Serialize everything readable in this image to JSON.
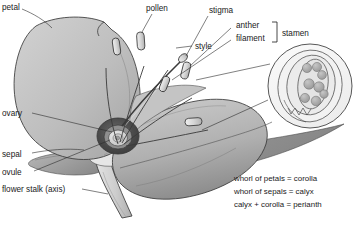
{
  "figure": {
    "background_color": "#ffffff"
  },
  "labels": {
    "petal": "petal",
    "pollen": "pollen",
    "stigma": "stigma",
    "style": "style",
    "anther": "anther",
    "filament": "filament",
    "stamen": "stamen",
    "ovary": "ovary",
    "sepal": "sepal",
    "ovule": "ovule",
    "flower_stalk": "flower stalk (axis)"
  },
  "legend": {
    "lines": [
      "whorl of petals = corolla",
      "whorl of sepals = calyx",
      "calyx + corolla = perianth"
    ]
  },
  "colors": {
    "petal_light": "#c9c9c9",
    "petal_mid": "#b4b4b4",
    "petal_dark": "#9a9a9a",
    "sepal": "#8e8e8e",
    "stalk": "#cfcfcf",
    "ovary_ring": "#4a4a4a",
    "ovule": "#d8d8d8",
    "outline": "#3a3a3a",
    "text": "#1a1a1a",
    "pollen_grain": "#a8a8a8"
  }
}
